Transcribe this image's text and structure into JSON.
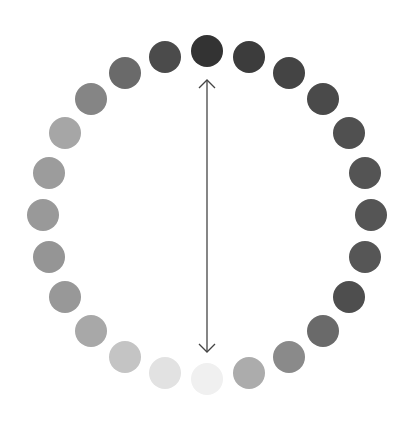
{
  "diagram": {
    "type": "hue-circle-grayscale",
    "center": [
      207,
      215
    ],
    "ring_radius": 164,
    "dot_radius": 16,
    "swatches": [
      {
        "index": 0,
        "color": "#333333"
      },
      {
        "index": 1,
        "color": "#3c3c3c"
      },
      {
        "index": 2,
        "color": "#444444"
      },
      {
        "index": 3,
        "color": "#4a4a4a"
      },
      {
        "index": 4,
        "color": "#505050"
      },
      {
        "index": 5,
        "color": "#545454"
      },
      {
        "index": 6,
        "color": "#555555"
      },
      {
        "index": 7,
        "color": "#565656"
      },
      {
        "index": 8,
        "color": "#4e4e4e"
      },
      {
        "index": 9,
        "color": "#6a6a6a"
      },
      {
        "index": 10,
        "color": "#8a8a8a"
      },
      {
        "index": 11,
        "color": "#acacac"
      },
      {
        "index": 12,
        "color": "#f0f0f0"
      },
      {
        "index": 13,
        "color": "#e2e2e2"
      },
      {
        "index": 14,
        "color": "#c4c4c4"
      },
      {
        "index": 15,
        "color": "#a8a8a8"
      },
      {
        "index": 16,
        "color": "#989898"
      },
      {
        "index": 17,
        "color": "#959595"
      },
      {
        "index": 18,
        "color": "#999999"
      },
      {
        "index": 19,
        "color": "#9c9c9c"
      },
      {
        "index": 20,
        "color": "#a6a6a6"
      },
      {
        "index": 21,
        "color": "#858585"
      },
      {
        "index": 22,
        "color": "#6a6a6a"
      },
      {
        "index": 23,
        "color": "#4b4b4b"
      }
    ],
    "arrow": {
      "style": "double-headed",
      "from": [
        207,
        80
      ],
      "to": [
        207,
        352
      ],
      "color": "#444444"
    }
  }
}
